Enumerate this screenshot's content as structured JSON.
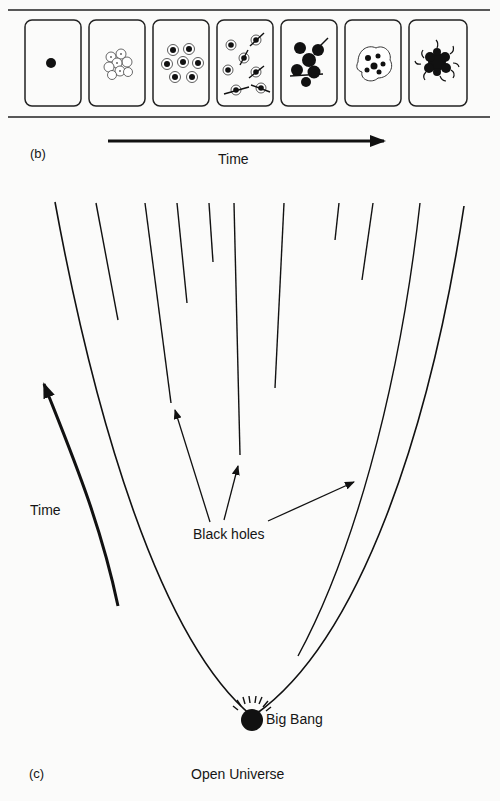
{
  "figure": {
    "panel_b": {
      "label": "(b)",
      "axis_label": "Time",
      "frames": [
        {
          "index": 1,
          "depiction": "single dot"
        },
        {
          "index": 2,
          "depiction": "cluster of light spheres"
        },
        {
          "index": 3,
          "depiction": "scattered dark-centered spheres"
        },
        {
          "index": 4,
          "depiction": "spheres with ejected jets"
        },
        {
          "index": 5,
          "depiction": "merging dark clumps"
        },
        {
          "index": 6,
          "depiction": "irregular clumpy blob"
        },
        {
          "index": 7,
          "depiction": "dense tangled mass"
        }
      ]
    },
    "panel_c": {
      "label": "(c)",
      "title": "Open Universe",
      "time_label": "Time",
      "annotation": "Black holes",
      "origin_label": "Big Bang"
    }
  },
  "colors": {
    "ink": "#111111",
    "paper": "#fbfbfa"
  }
}
